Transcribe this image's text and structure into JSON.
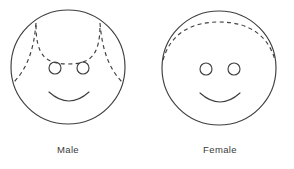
{
  "figure": {
    "background_color": "#ffffff",
    "line_color": "#3f3f42"
  },
  "panels": [
    {
      "id": "male",
      "caption": "Male",
      "face": {
        "center_x": 68,
        "center_y": 67,
        "radius": 57
      },
      "eyes": [
        {
          "cx": 55,
          "cy": 68,
          "r": 6
        },
        {
          "cx": 83,
          "cy": 68,
          "r": 6
        }
      ],
      "mouth": {
        "description": "smile-arc",
        "start_x": 49,
        "end_x": 89,
        "y": 92,
        "depth": 11
      },
      "hairline": {
        "style": "dashed",
        "pattern": "receding",
        "description": "Central arc dipping toward the brow with two curves sweeping down past the temples, forming bitemporal recession",
        "segments": [
          "center-arc",
          "left-temple-curve",
          "right-temple-curve"
        ]
      }
    },
    {
      "id": "female",
      "caption": "Female",
      "face": {
        "center_x": 219,
        "center_y": 68,
        "radius": 57
      },
      "eyes": [
        {
          "cx": 206,
          "cy": 69,
          "r": 6
        },
        {
          "cx": 234,
          "cy": 69,
          "r": 6
        }
      ],
      "mouth": {
        "description": "smile-arc",
        "start_x": 200,
        "end_x": 240,
        "y": 93,
        "depth": 11
      },
      "hairline": {
        "style": "dashed",
        "pattern": "continuous",
        "description": "A single unbroken dashed arc spanning the full width of the forehead with no temple recession",
        "segments": [
          "full-arc"
        ]
      }
    }
  ]
}
